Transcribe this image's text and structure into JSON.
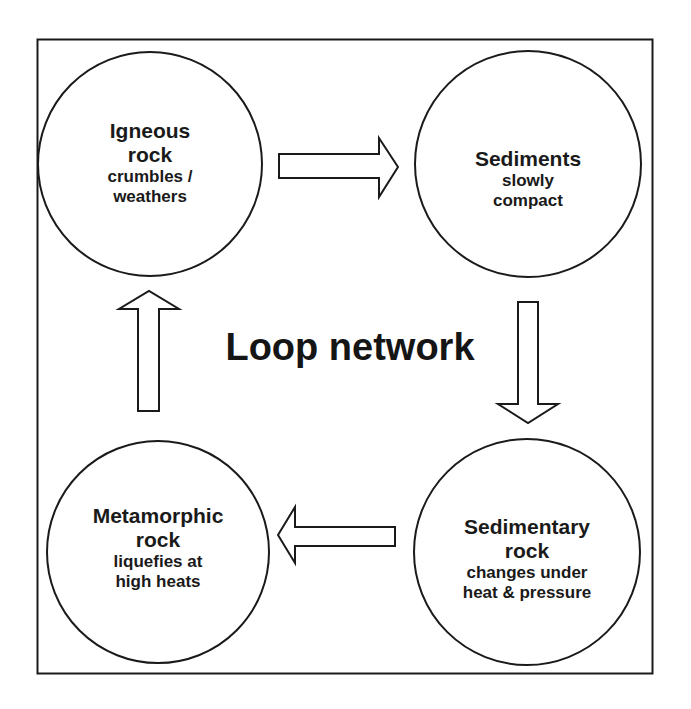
{
  "diagram": {
    "title": "Loop network",
    "nodes": [
      {
        "id": "igneous",
        "title_lines": [
          "Igneous",
          "rock"
        ],
        "sub_lines": [
          "crumbles /",
          "weathers"
        ]
      },
      {
        "id": "sediments",
        "title_lines": [
          "Sediments"
        ],
        "sub_lines": [
          "slowly",
          "compact"
        ]
      },
      {
        "id": "sedimentary",
        "title_lines": [
          "Sedimentary",
          "rock"
        ],
        "sub_lines": [
          "changes under",
          "heat & pressure"
        ]
      },
      {
        "id": "metamorphic",
        "title_lines": [
          "Metamorphic",
          "rock"
        ],
        "sub_lines": [
          "liquefies at",
          "high heats"
        ]
      }
    ],
    "edges": [
      {
        "from": "igneous",
        "to": "sediments",
        "direction": "right"
      },
      {
        "from": "sediments",
        "to": "sedimentary",
        "direction": "down"
      },
      {
        "from": "sedimentary",
        "to": "metamorphic",
        "direction": "left"
      },
      {
        "from": "metamorphic",
        "to": "igneous",
        "direction": "up"
      }
    ],
    "colors": {
      "stroke": "#1a1a1a",
      "fill": "#ffffff"
    }
  }
}
